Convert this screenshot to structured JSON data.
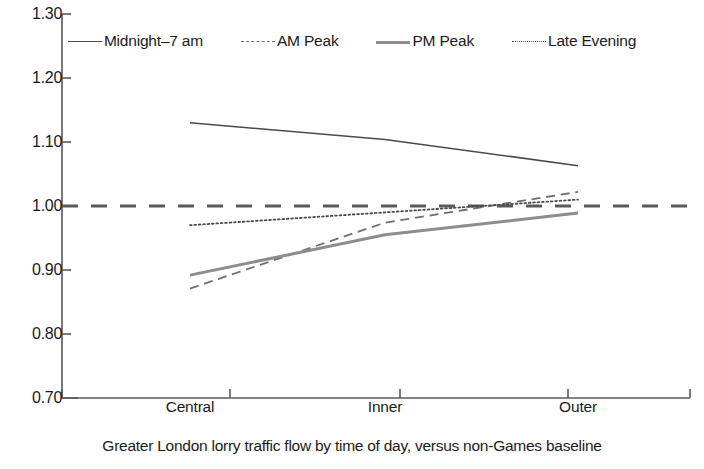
{
  "chart_data": {
    "type": "line",
    "title": "",
    "caption": "Greater London lorry traffic flow by time of day, versus non-Games baseline",
    "xlabel": "",
    "ylabel": "",
    "categories": [
      "Central",
      "Inner",
      "Outer"
    ],
    "ylim": [
      0.7,
      1.3
    ],
    "yticks": [
      "1.30",
      "1.20",
      "1.10",
      "1.00",
      "0.90",
      "0.80",
      "0.70"
    ],
    "ytick_values": [
      1.3,
      1.2,
      1.1,
      1.0,
      0.9,
      0.8,
      0.7
    ],
    "grid": false,
    "legend_position": "top",
    "reference_line": {
      "value": 1.0,
      "style": "dashed",
      "label": "1.00 baseline"
    },
    "series": [
      {
        "name": "Midnight-7 am",
        "style": "solid",
        "color": "#4a4a4a",
        "width": 1.6,
        "values": [
          1.13,
          1.104,
          1.063
        ]
      },
      {
        "name": "AM Peak",
        "style": "dashed",
        "color": "#6e6e6e",
        "width": 1.8,
        "values": [
          0.871,
          0.974,
          1.022
        ]
      },
      {
        "name": "PM Peak",
        "style": "solid",
        "color": "#8d8d8d",
        "width": 3.0,
        "values": [
          0.892,
          0.955,
          0.989
        ]
      },
      {
        "name": "Late Evening",
        "style": "dotted",
        "color": "#4a4a4a",
        "width": 1.8,
        "values": [
          0.97,
          0.99,
          1.01
        ]
      }
    ]
  },
  "legend": {
    "items": [
      {
        "label": "Midnight–7 am",
        "swatch": "solid-thin-line-icon"
      },
      {
        "label": "AM Peak",
        "swatch": "dashed-line-icon"
      },
      {
        "label": "PM Peak",
        "swatch": "solid-thick-line-icon"
      },
      {
        "label": "Late Evening",
        "swatch": "dotted-line-icon"
      }
    ]
  },
  "axes": {
    "y_labels": [
      "1.30",
      "1.20",
      "1.10",
      "1.00",
      "0.90",
      "0.80",
      "0.70"
    ],
    "x_labels": [
      "Central",
      "Inner",
      "Outer"
    ]
  },
  "caption": "Greater London lorry traffic flow by time of day, versus non-Games baseline",
  "colors": {
    "axis": "#5a5a5a",
    "text": "#1a1a1a",
    "midnight": "#4a4a4a",
    "am_peak": "#6e6e6e",
    "pm_peak": "#8d8d8d",
    "late_evening": "#4a4a4a",
    "baseline": "#5a5a5a"
  }
}
